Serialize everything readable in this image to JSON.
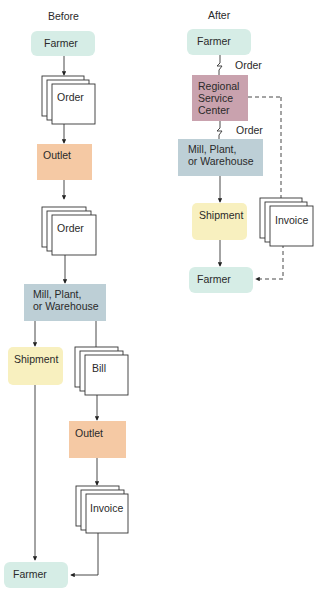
{
  "before": {
    "heading": "Before",
    "nodes": {
      "farmer_top": "Farmer",
      "order_1": "Order",
      "outlet_1": "Outlet",
      "order_2": "Order",
      "mill_line1": "Mill, Plant,",
      "mill_line2": "or Warehouse",
      "shipment": "Shipment",
      "bill": "Bill",
      "outlet_2": "Outlet",
      "invoice": "Invoice",
      "farmer_bottom": "Farmer"
    }
  },
  "after": {
    "heading": "After",
    "nodes": {
      "farmer_top": "Farmer",
      "order_label_1": "Order",
      "rsc_line1": "Regional",
      "rsc_line2": "Service",
      "rsc_line3": "Center",
      "order_label_2": "Order",
      "mill_line1": "Mill, Plant,",
      "mill_line2": "or Warehouse",
      "shipment": "Shipment",
      "invoice": "Invoice",
      "farmer_bottom": "Farmer"
    }
  },
  "colors": {
    "farmer": "#d6ede6",
    "outlet": "#f5c9a4",
    "mill": "#bdcfd6",
    "shipment": "#f8f0bf",
    "regional_service_center": "#c9a2ae"
  }
}
